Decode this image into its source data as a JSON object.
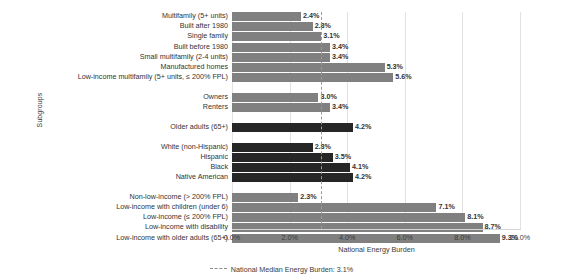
{
  "chart_data": {
    "type": "bar",
    "orientation": "horizontal",
    "title": "",
    "xlabel": "National Energy Burden",
    "ylabel": "Subgroups",
    "xlim": [
      0.0,
      10.0
    ],
    "xticks": [
      "0.0%",
      "2.0%",
      "4.0%",
      "6.0%",
      "8.0%",
      "10.0%"
    ],
    "xtick_values": [
      0.0,
      2.0,
      4.0,
      6.0,
      8.0,
      10.0
    ],
    "grid": true,
    "legend_position": "bottom-center",
    "annotations": [
      {
        "name": "national-median-energy-burden",
        "label": "National Median Energy Burden: 3.1%",
        "value": 3.1,
        "style": "dashed",
        "color": "#8d8d8d"
      }
    ],
    "colors": {
      "light": "#808080",
      "dark": "#262626",
      "grid": "#e2e2e2"
    },
    "groups": [
      {
        "name": "housing-type",
        "color": "light",
        "categories": [
          "Multifamily (5+ units)",
          "Built after 1980",
          "Single family",
          "Built before 1980",
          "Small multifamily (2-4 units)",
          "Manufactured homes",
          "Low-income multifamily (5+ units, ≤ 200% FPL)"
        ],
        "values": [
          2.4,
          2.8,
          3.1,
          3.4,
          3.4,
          5.3,
          5.6
        ],
        "labels": [
          "2.4%",
          "2.8%",
          "3.1%",
          "3.4%",
          "3.4%",
          "5.3%",
          "5.6%"
        ]
      },
      {
        "name": "tenure",
        "color": "light",
        "categories": [
          "Owners",
          "Renters"
        ],
        "values": [
          3.0,
          3.4
        ],
        "labels": [
          "3.0%",
          "3.4%"
        ]
      },
      {
        "name": "age",
        "color": "dark",
        "categories": [
          "Older adults (65+)"
        ],
        "values": [
          4.2
        ],
        "labels": [
          "4.2%"
        ]
      },
      {
        "name": "race-ethnicity",
        "color": "dark",
        "categories": [
          "White (non-Hispanic)",
          "Hispanic",
          "Black",
          "Native American"
        ],
        "values": [
          2.8,
          3.5,
          4.1,
          4.2
        ],
        "labels": [
          "2.8%",
          "3.5%",
          "4.1%",
          "4.2%"
        ]
      },
      {
        "name": "income",
        "color": "light",
        "categories": [
          "Non-low-income (> 200% FPL)",
          "Low-income with children (under 6)",
          "Low-income (≤ 200% FPL)",
          "Low-income with disability",
          "Low-income with older adults (65+)"
        ],
        "values": [
          2.3,
          7.1,
          8.1,
          8.7,
          9.3
        ],
        "labels": [
          "2.3%",
          "7.1%",
          "8.1%",
          "8.7%",
          "9.3%"
        ]
      }
    ]
  }
}
